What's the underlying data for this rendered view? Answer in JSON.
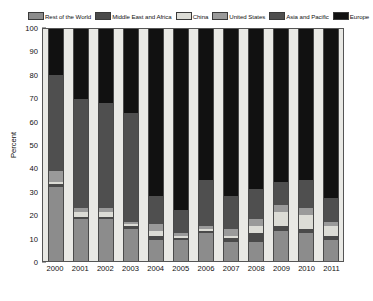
{
  "chart_data": {
    "type": "bar",
    "stacked": true,
    "title": "",
    "xlabel": "",
    "ylabel": "Percent",
    "ylim": [
      0,
      100
    ],
    "yticks": [
      0,
      10,
      20,
      30,
      40,
      50,
      60,
      70,
      80,
      90,
      100
    ],
    "grid": false,
    "legend_position": "top",
    "categories": [
      "2000",
      "2001",
      "2002",
      "2003",
      "2004",
      "2005",
      "2006",
      "2007",
      "2008",
      "2009",
      "2010",
      "2011"
    ],
    "series": [
      {
        "name": "Rest of the World",
        "color": "#8c8c8c",
        "values": [
          32,
          18,
          18,
          14,
          9,
          9,
          12,
          8,
          8,
          13,
          12,
          9
        ]
      },
      {
        "name": "Middle East and Africa",
        "color": "#4a4a4a",
        "values": [
          1,
          1,
          1,
          1,
          2,
          1,
          1,
          2,
          4,
          2,
          2,
          2
        ]
      },
      {
        "name": "China",
        "color": "#dcdcd6",
        "values": [
          1,
          2,
          2,
          1,
          2,
          1,
          1,
          1,
          3,
          6,
          6,
          4
        ]
      },
      {
        "name": "United States",
        "color": "#9a9a9a",
        "values": [
          5,
          2,
          2,
          1,
          3,
          1,
          1,
          3,
          3,
          3,
          3,
          2
        ]
      },
      {
        "name": "Asia and Pacific",
        "color": "#4f4f4f",
        "values": [
          41,
          47,
          45,
          47,
          12,
          10,
          20,
          14,
          13,
          10,
          12,
          10
        ]
      },
      {
        "name": "Europe",
        "color": "#111111",
        "values": [
          20,
          30,
          32,
          36,
          72,
          78,
          65,
          72,
          69,
          66,
          65,
          73
        ]
      }
    ]
  },
  "legend": {
    "entries": [
      {
        "label": "Rest of the World",
        "color": "#8c8c8c"
      },
      {
        "label": "Middle East and Africa",
        "color": "#4a4a4a"
      },
      {
        "label": "China",
        "color": "#dcdcd6"
      },
      {
        "label": "United States",
        "color": "#9a9a9a"
      },
      {
        "label": "Asia and Pacific",
        "color": "#4f4f4f"
      },
      {
        "label": "Europe",
        "color": "#111111"
      }
    ]
  }
}
